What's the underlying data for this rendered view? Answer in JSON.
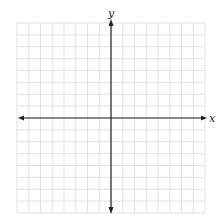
{
  "diagram": {
    "type": "coordinate-plane",
    "grid": {
      "columns": 16,
      "rows": 16,
      "left": 17,
      "top": 23,
      "right": 205,
      "bottom": 213,
      "line_color": "#d9d9d9",
      "axis_color": "#222222"
    },
    "axes": {
      "x_label": "x",
      "y_label": "y",
      "origin_col": 8,
      "origin_row": 8
    }
  }
}
